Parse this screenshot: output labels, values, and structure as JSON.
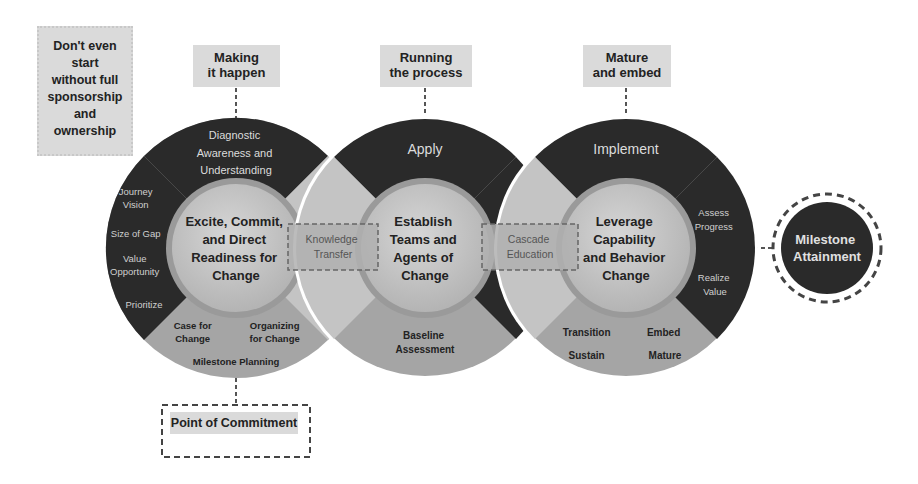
{
  "left_note": {
    "lines": [
      "Don't even",
      "start",
      "without full",
      "sponsorship",
      "and",
      "ownership"
    ]
  },
  "phases": [
    {
      "label_lines": [
        "Making",
        "it happen"
      ]
    },
    {
      "label_lines": [
        "Running",
        "the process"
      ]
    },
    {
      "label_lines": [
        "Mature",
        "and embed"
      ]
    }
  ],
  "circles": [
    {
      "center_lines": [
        "Excite, Commit,",
        "and Direct",
        "Readiness for",
        "Change"
      ],
      "top_lines": [
        "Diagnostic",
        "Awareness and",
        "Understanding"
      ],
      "left_items": [
        [
          "Journey",
          "Vision"
        ],
        [
          "Size of Gap"
        ],
        [
          "Value",
          "Opportunity"
        ],
        [
          "Prioritize"
        ]
      ],
      "bottom_items": [
        [
          "Case for",
          "Change"
        ],
        [
          "Organizing",
          "for Change"
        ],
        [
          "Milestone Planning"
        ]
      ]
    },
    {
      "center_lines": [
        "Establish",
        "Teams and",
        "Agents of",
        "Change"
      ],
      "top_lines": [
        "Apply"
      ],
      "bottom_lines": [
        "Baseline",
        "Assessment"
      ]
    },
    {
      "center_lines": [
        "Leverage",
        "Capability",
        "and Behavior",
        "Change"
      ],
      "top_lines": [
        "Implement"
      ],
      "right_items": [
        [
          "Assess",
          "Progress"
        ],
        [
          "Realize",
          "Value"
        ]
      ],
      "bottom_items": [
        [
          "Transition"
        ],
        [
          "Embed"
        ],
        [
          "Sustain"
        ],
        [
          "Mature"
        ]
      ]
    }
  ],
  "connectors": [
    {
      "lines": [
        "Knowledge",
        "Transfer"
      ]
    },
    {
      "lines": [
        "Cascade",
        "Education"
      ]
    }
  ],
  "milestone": {
    "lines": [
      "Milestone",
      "Attainment"
    ]
  },
  "commitment": {
    "label": "Point of Commitment"
  }
}
